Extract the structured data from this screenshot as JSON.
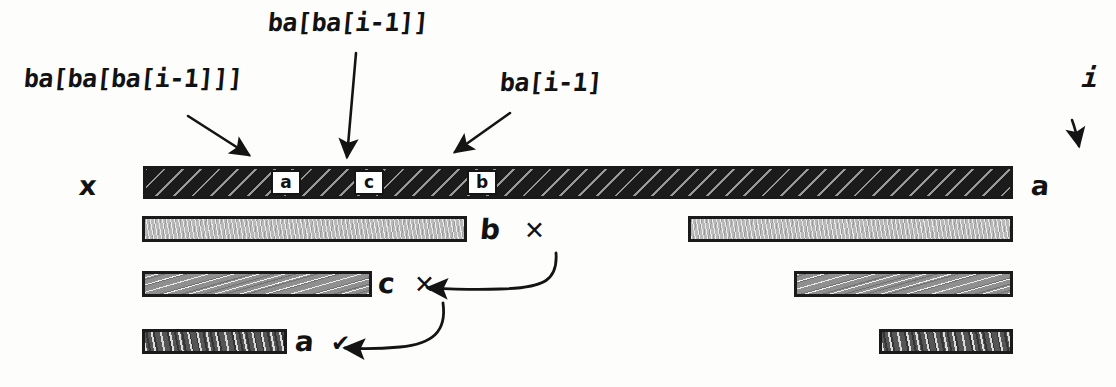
{
  "diagram": {
    "ink_color": "#141414",
    "background": "#fdfdfc"
  },
  "annotations": {
    "label_left": "ba[ba[ba[i-1]]]",
    "label_center": "ba[ba[i-1]]",
    "label_right": "ba[i-1]",
    "label_i": "i"
  },
  "main_bar": {
    "left_marker": "x",
    "right_marker": "a",
    "cells": [
      {
        "letter": "a"
      },
      {
        "letter": "c"
      },
      {
        "letter": "b"
      }
    ]
  },
  "rows": [
    {
      "letter": "b",
      "mark": "✕",
      "mark_kind": "cross"
    },
    {
      "letter": "c",
      "mark": "✕",
      "mark_kind": "cross"
    },
    {
      "letter": "a",
      "mark": "✔",
      "mark_kind": "check"
    }
  ]
}
